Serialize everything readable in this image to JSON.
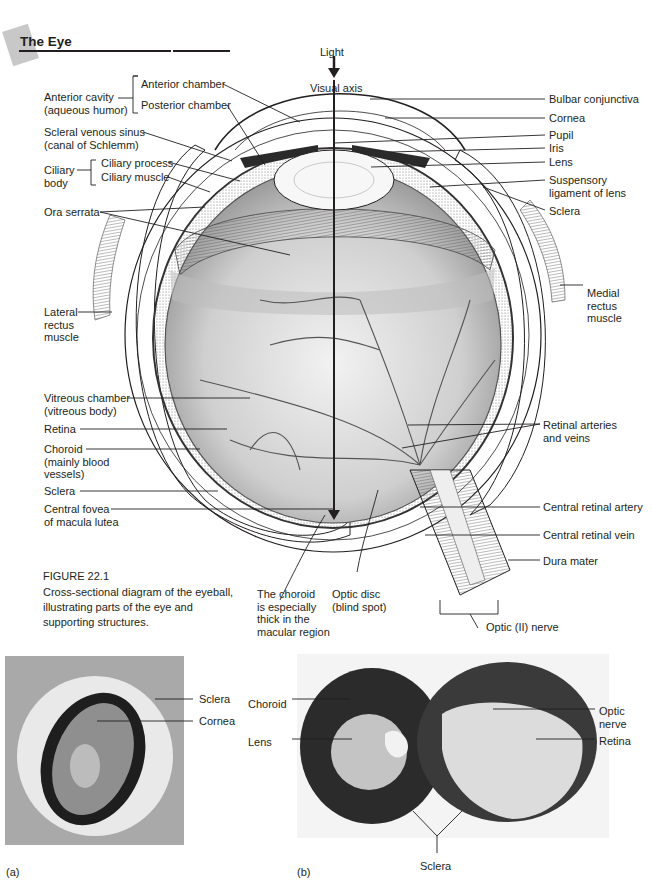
{
  "header": {
    "title": "The Eye"
  },
  "figure": {
    "number": "FIGURE 22.1",
    "caption": "Cross-sectional diagram of the eyeball, illustrating parts of the eye and supporting structures."
  },
  "diagram": {
    "top": {
      "light": "Light",
      "visual_axis": "Visual axis"
    },
    "left_labels": {
      "anterior_cavity": "Anterior cavity\n(aqueous humor)",
      "anterior_chamber": "Anterior chamber",
      "posterior_chamber": "Posterior chamber",
      "scleral_venous_sinus": "Scleral venous sinus\n(canal of Schlemm)",
      "ciliary_body": "Ciliary\nbody",
      "ciliary_process": "Ciliary process",
      "ciliary_muscle": "Ciliary muscle",
      "ora_serrata": "Ora serrata",
      "lateral_rectus": "Lateral\nrectus\nmuscle",
      "vitreous_chamber": "Vitreous chamber\n(vitreous body)",
      "retina": "Retina",
      "choroid": "Choroid\n(mainly blood\nvessels)",
      "sclera": "Sclera",
      "central_fovea": "Central fovea\nof macula lutea"
    },
    "right_labels": {
      "bulbar_conjunctiva": "Bulbar conjunctiva",
      "cornea": "Cornea",
      "pupil": "Pupil",
      "iris": "Iris",
      "lens": "Lens",
      "suspensory_ligament": "Suspensory\nligament of lens",
      "sclera": "Sclera",
      "medial_rectus": "Medial\nrectus\nmuscle",
      "retinal_arteries": "Retinal arteries\nand veins",
      "central_retinal_artery": "Central retinal artery",
      "central_retinal_vein": "Central retinal vein",
      "dura_mater": "Dura mater",
      "optic_nerve": "Optic (II) nerve"
    },
    "bottom_labels": {
      "choroid_thick": "The choroid\nis especially\nthick in the\nmacular region",
      "optic_disc": "Optic disc\n(blind spot)"
    }
  },
  "photos": {
    "a": {
      "letter": "(a)",
      "labels": {
        "sclera": "Sclera",
        "cornea": "Cornea"
      }
    },
    "b": {
      "letter": "(b)",
      "labels": {
        "choroid": "Choroid",
        "lens": "Lens",
        "optic_nerve": "Optic nerve",
        "retina": "Retina",
        "sclera": "Sclera"
      }
    }
  },
  "colors": {
    "ink": "#231f20",
    "title_tab": "#c8c8c8",
    "photo_a_bg": "#a9a9a9"
  }
}
